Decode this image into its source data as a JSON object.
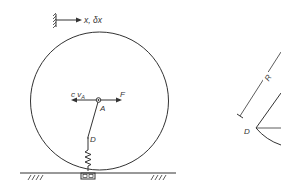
{
  "figure": {
    "left_diagram": {
      "reference_axis_label": "x, δx",
      "center_label": "A",
      "damping_force_label": "c v",
      "damping_force_subscript": "A",
      "applied_force_label": "F",
      "spring_attach_label": "D"
    },
    "right_diagram": {
      "radius_label": "R",
      "point_label": "D"
    },
    "colors": {
      "line": "#333333",
      "background": "#ffffff"
    }
  }
}
